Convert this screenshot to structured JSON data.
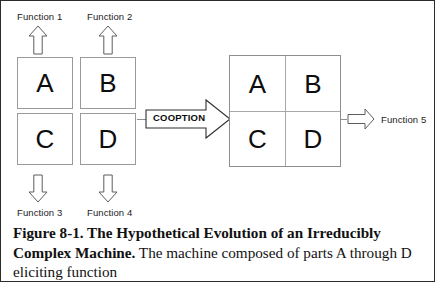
{
  "figure": {
    "border_color": "#2b2b2b",
    "background": "#ffffff"
  },
  "inputs": {
    "function_1": "Function 1",
    "function_2": "Function 2"
  },
  "outputs": {
    "function_3": "Function 3",
    "function_4": "Function 4",
    "function_5": "Function 5"
  },
  "parts": [
    {
      "letter": "A",
      "name": "part-a"
    },
    {
      "letter": "B",
      "name": "part-b"
    },
    {
      "letter": "C",
      "name": "part-c"
    },
    {
      "letter": "D",
      "name": "part-d"
    }
  ],
  "machine": {
    "cells": [
      {
        "letter": "A"
      },
      {
        "letter": "B"
      },
      {
        "letter": "C"
      },
      {
        "letter": "D"
      }
    ]
  },
  "process": {
    "label": "COOPTION"
  },
  "icons": {
    "arrow_up_1": "arrow-up-icon",
    "arrow_up_2": "arrow-up-icon",
    "arrow_down_3": "arrow-down-icon",
    "arrow_down_4": "arrow-down-icon",
    "arrow_right_cooption": "arrow-right-block-icon",
    "arrow_right_output": "arrow-right-icon"
  },
  "caption": {
    "title": "Figure 8-1. The Hypothetical Evolution of an Irreducibly Complex",
    "subject": "Machine.",
    "body": " The machine composed of parts A through D eliciting function"
  }
}
